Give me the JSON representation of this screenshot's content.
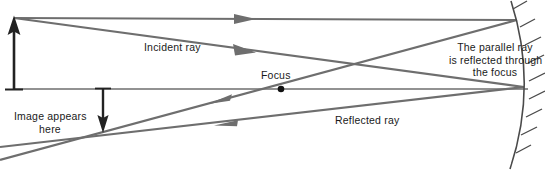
{
  "diagram": {
    "background_color": "#ffffff",
    "ray_color": "#6e6e6e",
    "object_color": "#222222",
    "mirror_color": "#4a4a4a",
    "text_color": "#1a1a1a",
    "labels": {
      "incident_ray": "Incident ray",
      "reflected_ray": "Reflected ray",
      "focus": "Focus",
      "image_appears_here": "Image appears\nhere",
      "parallel_ray_note": "The parallel ray\nis reflected through\nthe focus"
    },
    "points": {
      "object_tip": {
        "x": 14,
        "y": 18
      },
      "object_base": {
        "x": 14,
        "y": 89
      },
      "focus": {
        "x": 281,
        "y": 89
      },
      "mirror_vertex": {
        "x": 528,
        "y": 90
      },
      "mirror_top": {
        "x": 513,
        "y": 2
      },
      "mirror_bottom": {
        "x": 512,
        "y": 168
      },
      "image_tip": {
        "x": 103,
        "y": 130
      },
      "image_base": {
        "x": 103,
        "y": 89
      },
      "parallel_hit": {
        "x": 516,
        "y": 20
      },
      "focal_hit": {
        "x": 522,
        "y": 86
      }
    },
    "rays": [
      {
        "name": "parallel-incident-ray",
        "from": {
          "x": 14,
          "y": 18
        },
        "to": {
          "x": 516,
          "y": 20
        },
        "arrow_at": {
          "x": 250,
          "y": 19
        },
        "direction": "right"
      },
      {
        "name": "focal-incident-ray",
        "from": {
          "x": 14,
          "y": 18
        },
        "to": {
          "x": 523,
          "y": 87
        },
        "arrow_at": {
          "x": 248,
          "y": 50
        },
        "direction": "right"
      },
      {
        "name": "parallel-reflected-ray",
        "from": {
          "x": 516,
          "y": 20
        },
        "to": {
          "x": 0,
          "y": 159
        },
        "arrow_at": {
          "x": 225,
          "y": 98
        },
        "direction": "left"
      },
      {
        "name": "focal-reflected-ray",
        "from": {
          "x": 523,
          "y": 87
        },
        "to": {
          "x": 0,
          "y": 148
        },
        "arrow_at": {
          "x": 230,
          "y": 121
        },
        "direction": "left"
      }
    ],
    "principal_axis": {
      "from_x": 14,
      "to_x": 528,
      "y": 89
    },
    "mirror": {
      "type": "concave-arc",
      "hatch_count": 9,
      "hatch_side": "right"
    }
  }
}
